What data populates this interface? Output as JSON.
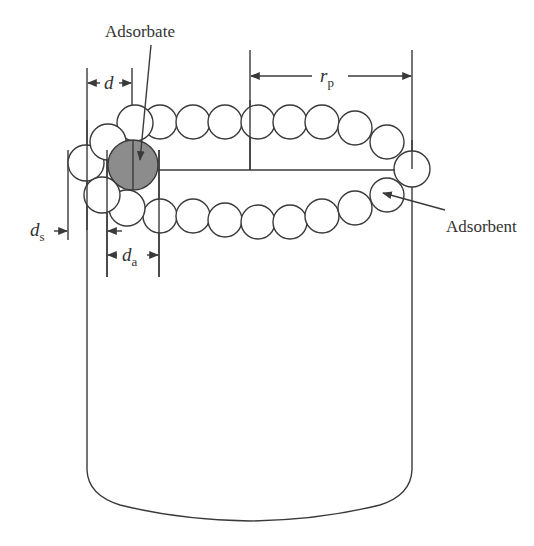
{
  "labels": {
    "adsorbate": "Adsorbate",
    "adsorbent": "Adsorbent",
    "d": "d",
    "d_s": "d",
    "d_s_sub": "s",
    "d_a": "d",
    "d_a_sub": "a",
    "r_p": "r",
    "r_p_sub": "p"
  },
  "colors": {
    "adsorbate_fill": "#8c8c8c",
    "line": "#3a3a3a"
  }
}
